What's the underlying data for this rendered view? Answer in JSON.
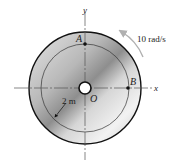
{
  "diagram": {
    "axes": {
      "x_label": "x",
      "y_label": "y"
    },
    "origin_label": "O",
    "points": [
      {
        "label": "A",
        "position": "top of inner circle on y-axis"
      },
      {
        "label": "B",
        "position": "right of inner circle on x-axis"
      }
    ],
    "angular_velocity_label": "10 rad/s",
    "radius_label": "2 m",
    "colors": {
      "outline": "#111111",
      "disk_light": "#f2f2f2",
      "disk_dark": "#9a9a9a",
      "arrow": "#b0b0b0"
    }
  }
}
